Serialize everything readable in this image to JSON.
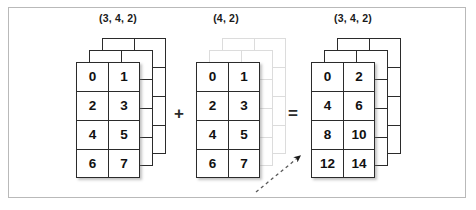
{
  "figure": {
    "title": "",
    "border_color": "#b9b9b9",
    "background_color": "#ffffff",
    "cell_line_color": "#2b2b2b",
    "ghost_line_color": "#dcdcdc"
  },
  "operands": [
    {
      "name": "left-operand",
      "shape_label": "(3, 4, 2)",
      "depth_layers": 3,
      "ghost": false,
      "rows": [
        [
          "0",
          "1"
        ],
        [
          "2",
          "3"
        ],
        [
          "4",
          "5"
        ],
        [
          "6",
          "7"
        ]
      ]
    },
    {
      "name": "right-operand",
      "shape_label": "(4, 2)",
      "depth_layers": 3,
      "ghost": true,
      "rows": [
        [
          "0",
          "1"
        ],
        [
          "2",
          "3"
        ],
        [
          "4",
          "5"
        ],
        [
          "6",
          "7"
        ]
      ]
    },
    {
      "name": "result",
      "shape_label": "(3, 4, 2)",
      "depth_layers": 3,
      "ghost": false,
      "rows": [
        [
          "0",
          "2"
        ],
        [
          "4",
          "6"
        ],
        [
          "8",
          "10"
        ],
        [
          "12",
          "14"
        ]
      ]
    }
  ],
  "operators": {
    "plus": "+",
    "equals": "="
  },
  "annotation": {
    "arrow_name": "broadcast-arrow",
    "arrow_style": "dashed",
    "arrow_direction": "up-right"
  }
}
